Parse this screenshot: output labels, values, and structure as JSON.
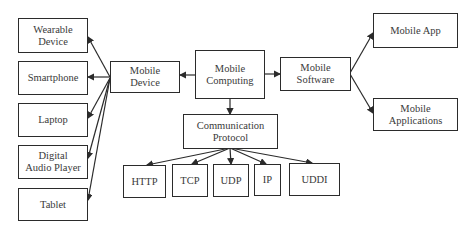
{
  "diagram": {
    "type": "hierarchy",
    "nodes": {
      "mobile_computing": "Mobile\nComputing",
      "mobile_device": "Mobile\nDevice",
      "mobile_software": "Mobile\nSoftware",
      "communication_protocol": "Communication\nProtocol",
      "wearable_device": "Wearable\nDevice",
      "smartphone": "Smartphone",
      "laptop": "Laptop",
      "digital_audio_player": "Digital\nAudio Player",
      "tablet": "Tablet",
      "mobile_app": "Mobile App",
      "mobile_applications": "Mobile\nApplications",
      "http": "HTTP",
      "tcp": "TCP",
      "udp": "UDP",
      "ip": "IP",
      "uddi": "UDDI"
    },
    "edges": [
      [
        "mobile_computing",
        "mobile_device"
      ],
      [
        "mobile_computing",
        "mobile_software"
      ],
      [
        "mobile_computing",
        "communication_protocol"
      ],
      [
        "mobile_device",
        "wearable_device"
      ],
      [
        "mobile_device",
        "smartphone"
      ],
      [
        "mobile_device",
        "laptop"
      ],
      [
        "mobile_device",
        "digital_audio_player"
      ],
      [
        "mobile_device",
        "tablet"
      ],
      [
        "mobile_software",
        "mobile_app"
      ],
      [
        "mobile_software",
        "mobile_applications"
      ],
      [
        "communication_protocol",
        "http"
      ],
      [
        "communication_protocol",
        "tcp"
      ],
      [
        "communication_protocol",
        "udp"
      ],
      [
        "communication_protocol",
        "ip"
      ],
      [
        "communication_protocol",
        "uddi"
      ]
    ],
    "colors": {
      "line": "#2b2b2b",
      "text": "#3a3a3a",
      "background": "#ffffff"
    }
  }
}
